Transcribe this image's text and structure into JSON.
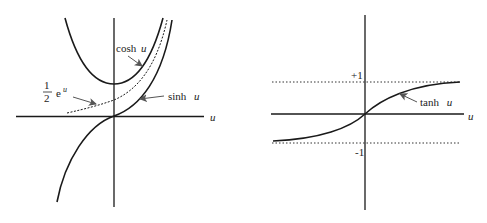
{
  "left_graph": {
    "axis_label_x": "u",
    "labels": {
      "cosh": "cosh",
      "sinh": "sinh",
      "var": "u",
      "half_num": "1",
      "half_den": "2",
      "exp_base": "e",
      "exp_power": "u"
    },
    "curves": [
      "cosh u",
      "sinh u",
      "1/2 e^u"
    ]
  },
  "right_graph": {
    "axis_label_x": "u",
    "labels": {
      "tanh": "tanh",
      "var": "u",
      "plus_one": "+1",
      "minus_one": "-1"
    },
    "asymptotes": [
      1,
      -1
    ],
    "curves": [
      "tanh u"
    ]
  },
  "colors": {
    "ink": "#1a1a1a",
    "arrow": "#555555",
    "background": "#ffffff"
  }
}
